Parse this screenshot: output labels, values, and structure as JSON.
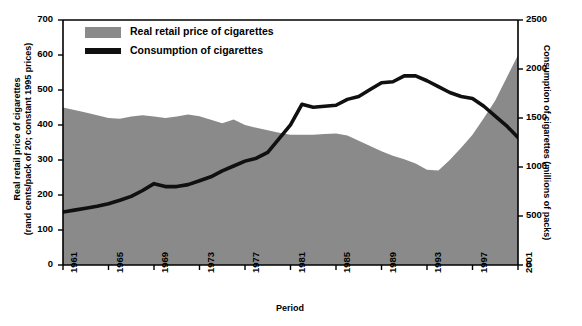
{
  "chart_data": {
    "type": "area",
    "title": "",
    "xlabel": "Period",
    "ylabel": "Real retail price of cigarettes\n(rand cents/pack of 20; constant 1995 prices)",
    "ylabel_left_line1": "Real retail price of cigarettes",
    "ylabel_left_line2": "(rand cents/pack of 20; constant 1995 prices)",
    "ylabel_right": "Consumption of cigarettes (millions of packs)",
    "grid": false,
    "legend_position": "top-left",
    "ylim": [
      0,
      700
    ],
    "y2lim": [
      0,
      2500
    ],
    "xlim": [
      1961,
      2001
    ],
    "yticks": [
      0,
      100,
      200,
      300,
      400,
      500,
      600,
      700
    ],
    "y2ticks": [
      0,
      500,
      1000,
      1500,
      2000,
      2500
    ],
    "xticks": [
      1961,
      1965,
      1969,
      1973,
      1977,
      1981,
      1985,
      1989,
      1993,
      1997,
      2001
    ],
    "xtick_labels": [
      "1961",
      "1965",
      "1969",
      "1973",
      "1977",
      "1981",
      "1985",
      "1989",
      "1993",
      "1997",
      "2001"
    ],
    "x": [
      1961,
      1962,
      1963,
      1964,
      1965,
      1966,
      1967,
      1968,
      1969,
      1970,
      1971,
      1972,
      1973,
      1974,
      1975,
      1976,
      1977,
      1978,
      1979,
      1980,
      1981,
      1982,
      1983,
      1984,
      1985,
      1986,
      1987,
      1988,
      1989,
      1990,
      1991,
      1992,
      1993,
      1994,
      1995,
      1996,
      1997,
      1998,
      1999,
      2000,
      2001
    ],
    "series": [
      {
        "name": "Real retail price of cigarettes",
        "kind": "area",
        "axis": "left",
        "color": "#8a8a8a",
        "units": "rand cents/pack of 20 (constant 1995 prices)",
        "values": [
          450,
          443,
          436,
          428,
          420,
          418,
          424,
          428,
          424,
          420,
          424,
          430,
          425,
          415,
          405,
          416,
          400,
          392,
          385,
          378,
          372,
          372,
          372,
          374,
          376,
          370,
          355,
          340,
          325,
          312,
          302,
          290,
          272,
          270,
          300,
          335,
          372,
          420,
          470,
          535,
          600
        ]
      },
      {
        "name": "Consumption of cigarettes",
        "kind": "line",
        "axis": "right",
        "color": "#101010",
        "units": "millions of packs",
        "values": [
          540,
          560,
          580,
          600,
          625,
          660,
          700,
          760,
          830,
          800,
          800,
          820,
          860,
          900,
          960,
          1010,
          1060,
          1090,
          1150,
          1290,
          1430,
          1640,
          1610,
          1620,
          1630,
          1690,
          1720,
          1790,
          1860,
          1870,
          1930,
          1930,
          1880,
          1820,
          1760,
          1720,
          1700,
          1620,
          1520,
          1420,
          1300
        ]
      }
    ]
  },
  "legend": {
    "items": [
      {
        "label": "Real retail price of cigarettes",
        "marker": "area-swatch",
        "color": "#8a8a8a"
      },
      {
        "label": "Consumption of cigarettes",
        "marker": "line-swatch",
        "color": "#101010"
      }
    ]
  },
  "colors": {
    "area_fill": "#8a8a8a",
    "line": "#101010",
    "axis": "#000000",
    "background": "#ffffff"
  }
}
